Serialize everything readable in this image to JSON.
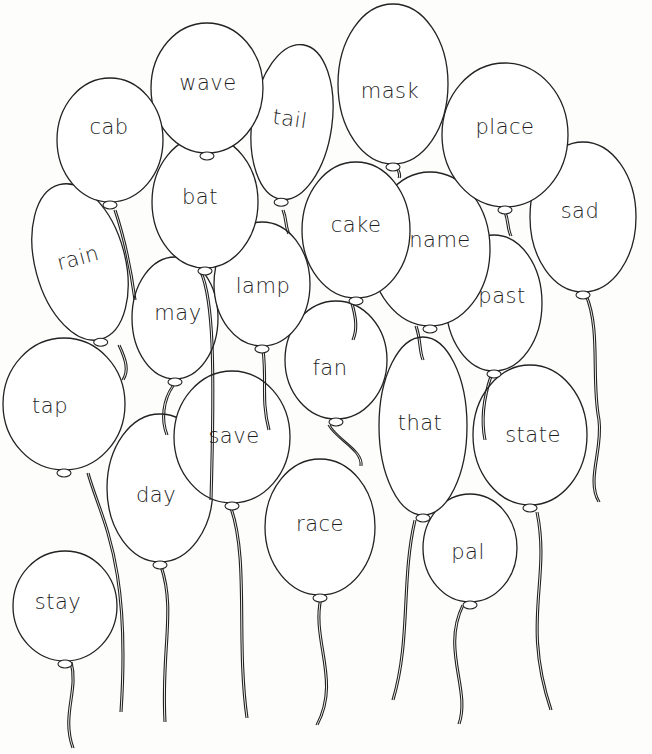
{
  "colors": {
    "ink": "#222222",
    "paper": "#ffffff"
  },
  "balloons": [
    {
      "word": "stay",
      "cx": 65,
      "cy": 606,
      "rx": 52,
      "ry": 55,
      "rot": 0,
      "tx": 58,
      "ty": 602,
      "string": "M70,662 C78,690 60,715 72,748"
    },
    {
      "word": "tap",
      "cx": 64,
      "cy": 404,
      "rx": 61,
      "ry": 66,
      "rot": 0,
      "tx": 50,
      "ty": 406,
      "string": "M87,473 C100,520 130,560 120,712"
    },
    {
      "word": "day",
      "cx": 160,
      "cy": 488,
      "rx": 53,
      "ry": 74,
      "rot": 0,
      "tx": 156,
      "ty": 495,
      "string": "M160,566 C175,610 160,650 164,722"
    },
    {
      "word": "race",
      "cx": 320,
      "cy": 527,
      "rx": 55,
      "ry": 68,
      "rot": 0,
      "tx": 320,
      "ty": 524,
      "string": "M320,598 C310,640 340,680 316,725"
    },
    {
      "word": "save",
      "cx": 232,
      "cy": 437,
      "rx": 58,
      "ry": 66,
      "rot": 0,
      "tx": 234,
      "ty": 436,
      "string": "M230,508 C248,560 235,640 246,718"
    },
    {
      "word": "pal",
      "cx": 470,
      "cy": 548,
      "rx": 47,
      "ry": 54,
      "rot": 0,
      "tx": 468,
      "ty": 552,
      "string": "M462,605 C440,650 470,690 458,724"
    },
    {
      "word": "state",
      "cx": 530,
      "cy": 435,
      "rx": 57,
      "ry": 70,
      "rot": 0,
      "tx": 533,
      "ty": 435,
      "string": "M536,512 C550,580 520,620 550,710"
    },
    {
      "word": "that",
      "cx": 423,
      "cy": 426,
      "rx": 44,
      "ry": 89,
      "rot": 0,
      "tx": 420,
      "ty": 423,
      "string": "M414,520 C400,580 410,640 392,700"
    },
    {
      "word": "fan",
      "cx": 336,
      "cy": 360,
      "rx": 51,
      "ry": 59,
      "rot": 0,
      "tx": 330,
      "ty": 368,
      "string": "M328,425 C336,440 362,450 360,466"
    },
    {
      "word": "may",
      "cx": 175,
      "cy": 318,
      "rx": 43,
      "ry": 61,
      "rot": 0,
      "tx": 178,
      "ty": 313,
      "string": "M172,386 C162,400 160,420 166,435"
    },
    {
      "word": "lamp",
      "cx": 262,
      "cy": 284,
      "rx": 48,
      "ry": 62,
      "rot": 0,
      "tx": 263,
      "ty": 286,
      "string": "M262,350 C266,380 260,400 268,430"
    },
    {
      "word": "past",
      "cx": 494,
      "cy": 303,
      "rx": 48,
      "ry": 68,
      "rot": 0,
      "tx": 502,
      "ty": 296,
      "string": "M490,376 C482,400 480,420 484,440"
    },
    {
      "word": "rain",
      "cx": 80,
      "cy": 262,
      "rx": 45,
      "ry": 80,
      "rot": -15,
      "tx": 78,
      "ty": 258,
      "string": "M118,345 C125,360 128,370 122,380"
    },
    {
      "word": "sad",
      "cx": 583,
      "cy": 217,
      "rx": 53,
      "ry": 75,
      "rot": 0,
      "tx": 580,
      "ty": 211,
      "string": "M585,295 C600,330 590,380 598,420 C602,450 585,480 598,502"
    },
    {
      "word": "name",
      "cx": 430,
      "cy": 249,
      "rx": 60,
      "ry": 77,
      "rot": 0,
      "tx": 440,
      "ty": 240,
      "string": "M415,326 C420,340 418,350 422,360"
    },
    {
      "word": "cake",
      "cx": 356,
      "cy": 230,
      "rx": 54,
      "ry": 68,
      "rot": 0,
      "tx": 356,
      "ty": 225,
      "string": "M350,300 C356,320 356,330 352,340"
    },
    {
      "word": "bat",
      "cx": 205,
      "cy": 202,
      "rx": 53,
      "ry": 66,
      "rot": 0,
      "tx": 200,
      "ty": 197,
      "string": "M200,272 C212,300 214,360 210,500"
    },
    {
      "word": "place",
      "cx": 505,
      "cy": 135,
      "rx": 63,
      "ry": 72,
      "rot": 0,
      "tx": 505,
      "ty": 127,
      "string": "M504,212 C508,222 506,228 510,236"
    },
    {
      "word": "mask",
      "cx": 393,
      "cy": 84,
      "rx": 55,
      "ry": 80,
      "rot": 0,
      "tx": 390,
      "ty": 91,
      "string": "M396,168 C398,172 400,175 398,178"
    },
    {
      "word": "tail",
      "cx": 292,
      "cy": 122,
      "rx": 40,
      "ry": 78,
      "rot": 8,
      "tx": 290,
      "ty": 119,
      "string": "M282,210 C286,220 284,226 288,234"
    },
    {
      "word": "wave",
      "cx": 207,
      "cy": 88,
      "rx": 56,
      "ry": 65,
      "rot": 0,
      "tx": 208,
      "ty": 83,
      "string": "M207,150 L207,152"
    },
    {
      "word": "cab",
      "cx": 110,
      "cy": 140,
      "rx": 53,
      "ry": 62,
      "rot": 0,
      "tx": 109,
      "ty": 127,
      "string": "M114,210 C124,240 130,270 134,300"
    }
  ]
}
